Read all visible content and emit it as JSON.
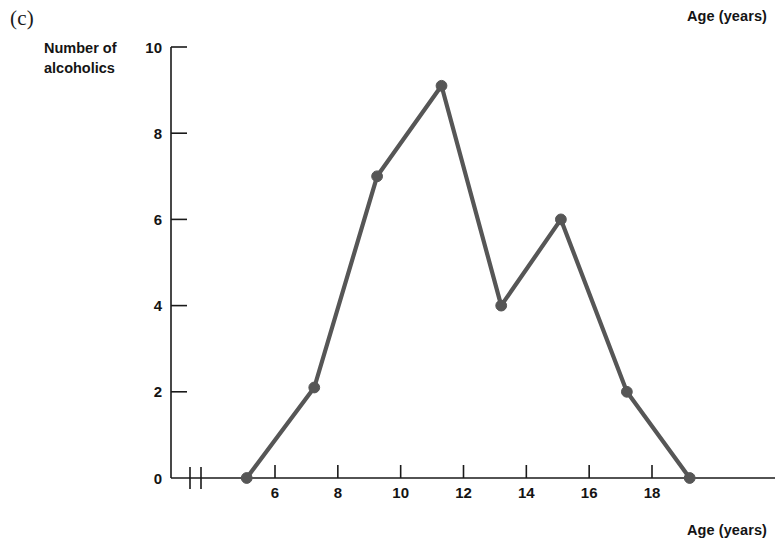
{
  "figure": {
    "panel_letter": "(c)",
    "top_right_label": "Age (years)",
    "bottom_right_label": "Age (years)",
    "y_axis_title_line1": "Number of",
    "y_axis_title_line2": "alcoholics",
    "line_color": "#565656",
    "axis_color": "#1a1a1a"
  },
  "chart_data": {
    "type": "line",
    "title": "",
    "subtitle": "",
    "xlabel": "Age (years)",
    "ylabel": "Number of alcoholics",
    "xlim": [
      4.3,
      19.8
    ],
    "ylim": [
      0,
      10
    ],
    "grid": false,
    "legend": "none",
    "axis_break_on_x": true,
    "x_ticks": [
      6,
      8,
      10,
      12,
      14,
      16,
      18
    ],
    "y_ticks": [
      0,
      2,
      4,
      6,
      8,
      10
    ],
    "x_tick_labels": [
      "6",
      "8",
      "10",
      "12",
      "14",
      "16",
      "18"
    ],
    "y_tick_labels": [
      "0",
      "2",
      "4",
      "6",
      "8",
      "10"
    ],
    "marker": "filled-circle",
    "series": [
      {
        "name": "Number of alcoholics",
        "x": [
          5.1,
          7.25,
          9.25,
          11.3,
          13.2,
          15.1,
          17.2,
          19.2
        ],
        "values": [
          0,
          2.1,
          7,
          9.1,
          4,
          6,
          2,
          0
        ]
      }
    ]
  }
}
